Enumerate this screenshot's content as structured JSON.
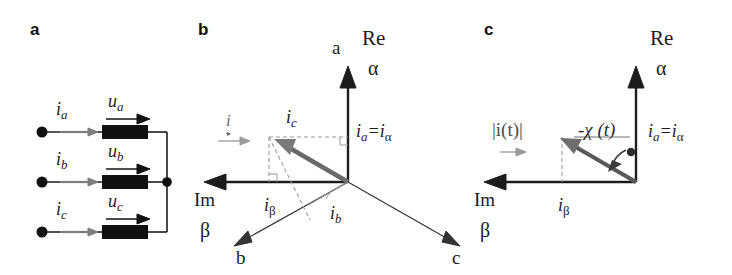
{
  "figure": {
    "type": "diagram",
    "panels": [
      {
        "letter": "a",
        "name": "three-phase-circuit",
        "phases": [
          {
            "current_label": "i",
            "current_sub": "a",
            "voltage_label": "u",
            "voltage_sub": "a"
          },
          {
            "current_label": "i",
            "current_sub": "b",
            "voltage_label": "u",
            "voltage_sub": "b"
          },
          {
            "current_label": "i",
            "current_sub": "c",
            "voltage_label": "u",
            "voltage_sub": "c"
          }
        ]
      },
      {
        "letter": "b",
        "name": "space-vector-components",
        "axes": {
          "vertical_phase": "a",
          "vertical_real": "Re",
          "vertical_alpha": "α",
          "horizontal_imag": "Im",
          "horizontal_beta": "β",
          "down_left": "b",
          "down_right": "c"
        },
        "labels": {
          "resultant": "i",
          "ic": {
            "base": "i",
            "sub": "c"
          },
          "ib": {
            "base": "i",
            "sub": "b"
          },
          "ibeta": {
            "base": "i",
            "sub": "β"
          },
          "ia_eq_ialpha": {
            "base1": "i",
            "sub1": "a",
            "eq": "=",
            "base2": "i",
            "sub2": "α"
          }
        }
      },
      {
        "letter": "c",
        "name": "space-vector-magnitude-angle",
        "axes": {
          "vertical_real": "Re",
          "vertical_alpha": "α",
          "horizontal_imag": "Im",
          "horizontal_beta": "β"
        },
        "labels": {
          "magnitude": "|i(t)|",
          "angle": "χ (t)",
          "angle_prefix": "-",
          "ibeta": {
            "base": "i",
            "sub": "β"
          },
          "ia_eq_ialpha": {
            "base1": "i",
            "sub1": "a",
            "eq": "=",
            "base2": "i",
            "sub2": "α"
          }
        }
      }
    ]
  },
  "colors": {
    "ink": "#1c1c1c",
    "grey": "#6f6f6f",
    "vector": "#5e5e5e",
    "dashed": "#8a8a8a",
    "background": "#ffffff"
  }
}
